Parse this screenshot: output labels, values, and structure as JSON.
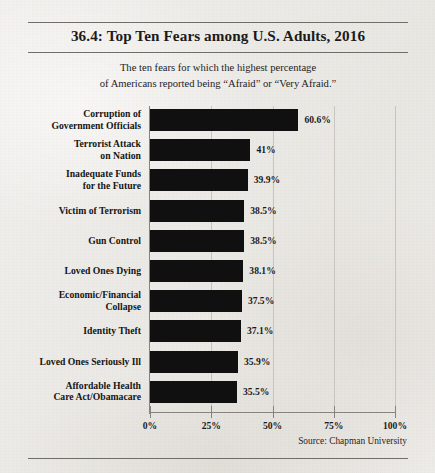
{
  "chart_data": {
    "type": "bar",
    "orientation": "horizontal",
    "title": "36.4: Top Ten Fears among U.S. Adults, 2016",
    "subtitle_lines": [
      "The ten fears for which the highest percentage",
      "of Americans reported being “Afraid” or “Very Afraid.”"
    ],
    "xlabel": "",
    "ylabel": "",
    "xlim": [
      0,
      100
    ],
    "xticks": [
      0,
      25,
      50,
      75,
      100
    ],
    "xtick_labels": [
      "0%",
      "25%",
      "50%",
      "75%",
      "100%"
    ],
    "grid": true,
    "grid_axis": "x",
    "legend": false,
    "bar_color": "#101010",
    "background_color": "#eceae6",
    "categories": [
      "Corruption of Government Officials",
      "Terrorist Attack on Nation",
      "Inadequate Funds for the Future",
      "Victim of Terrorism",
      "Gun Control",
      "Loved Ones Dying",
      "Economic/Financial Collapse",
      "Identity Theft",
      "Loved Ones Seriously Ill",
      "Affordable Health Care Act/Obamacare"
    ],
    "category_lines": [
      [
        "Corruption of",
        "Government Officials"
      ],
      [
        "Terrorist Attack",
        "on Nation"
      ],
      [
        "Inadequate Funds",
        "for the Future"
      ],
      [
        "Victim of Terrorism"
      ],
      [
        "Gun Control"
      ],
      [
        "Loved Ones Dying"
      ],
      [
        "Economic/Financial",
        "Collapse"
      ],
      [
        "Identity Theft"
      ],
      [
        "Loved Ones Seriously Ill"
      ],
      [
        "Affordable Health",
        "Care Act/Obamacare"
      ]
    ],
    "values": [
      60.6,
      41,
      39.9,
      38.5,
      38.5,
      38.1,
      37.5,
      37.1,
      35.9,
      35.5
    ],
    "value_labels": [
      "60.6%",
      "41%",
      "39.9%",
      "38.5%",
      "38.5%",
      "38.1%",
      "37.5%",
      "37.1%",
      "35.9%",
      "35.5%"
    ],
    "source": "Source:  Chapman University"
  }
}
